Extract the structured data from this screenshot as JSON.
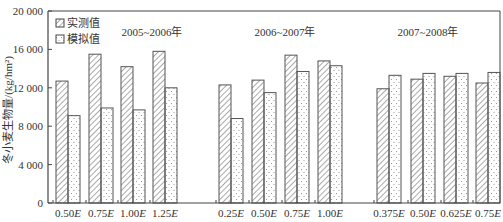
{
  "chart_data": {
    "type": "bar",
    "title": "",
    "xlabel": "",
    "ylabel": "冬小麦生物量/(kg/hm²)",
    "ylim": [
      0,
      20000
    ],
    "yticks": [
      0,
      4000,
      8000,
      12000,
      16000,
      20000
    ],
    "ytick_labels": [
      "0",
      "4 000",
      "8 000",
      "12 000",
      "16 000",
      "20 000"
    ],
    "grid": false,
    "legend_position": "upper left",
    "legend": [
      "实测值",
      "模拟值"
    ],
    "groups": [
      {
        "label": "2005~2006年",
        "categories": [
          "0.50E",
          "0.75E",
          "1.00E",
          "1.25E"
        ],
        "series": [
          {
            "name": "实测值",
            "values": [
              12700,
              15500,
              14200,
              15800
            ]
          },
          {
            "name": "模拟值",
            "values": [
              9100,
              9900,
              9700,
              12000
            ]
          }
        ]
      },
      {
        "label": "2006~2007年",
        "categories": [
          "0.25E",
          "0.50E",
          "0.75E",
          "1.00E"
        ],
        "series": [
          {
            "name": "实测值",
            "values": [
              12300,
              12800,
              15400,
              14800
            ]
          },
          {
            "name": "模拟值",
            "values": [
              8800,
              11500,
              13700,
              14300
            ]
          }
        ]
      },
      {
        "label": "2007~2008年",
        "categories": [
          "0.375E",
          "0.50E",
          "0.625E",
          "0.75E"
        ],
        "series": [
          {
            "name": "实测值",
            "values": [
              11900,
              12900,
              13200,
              12500
            ]
          },
          {
            "name": "模拟值",
            "values": [
              13300,
              13500,
              13500,
              13600
            ]
          }
        ]
      }
    ]
  },
  "colors": {
    "axis": "#444444",
    "bar_stroke": "#555555",
    "hatch": "#555555",
    "dots": "#888888"
  }
}
